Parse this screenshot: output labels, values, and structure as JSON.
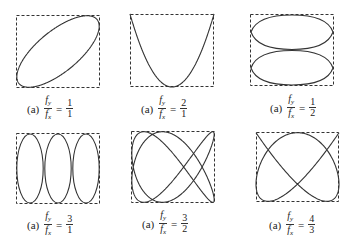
{
  "figure": {
    "panels": [
      {
        "id": "p1",
        "label": "(a)",
        "fy": 1,
        "fx": 1,
        "ratio_num": "1",
        "ratio_den": "1",
        "shape": "tilted ellipse"
      },
      {
        "id": "p2",
        "label": "(a)",
        "fy": 2,
        "fx": 1,
        "ratio_num": "2",
        "ratio_den": "1",
        "shape": "parabola"
      },
      {
        "id": "p3",
        "label": "(a)",
        "fy": 1,
        "fx": 2,
        "ratio_num": "1",
        "ratio_den": "2",
        "shape": "two stacked lenses"
      },
      {
        "id": "p4",
        "label": "(a)",
        "fy": 3,
        "fx": 1,
        "ratio_num": "3",
        "ratio_den": "1",
        "shape": "three vertical loops"
      },
      {
        "id": "p5",
        "label": "(a)",
        "fy": 3,
        "fx": 2,
        "ratio_num": "3",
        "ratio_den": "2",
        "shape": "lissajous 3:2"
      },
      {
        "id": "p6",
        "label": "(a)",
        "fy": 4,
        "fx": 3,
        "ratio_num": "4",
        "ratio_den": "3",
        "shape": "lissajous 4:3"
      }
    ],
    "symbols": {
      "f": "f",
      "sub_y": "y",
      "sub_x": "x",
      "equals": "="
    }
  }
}
